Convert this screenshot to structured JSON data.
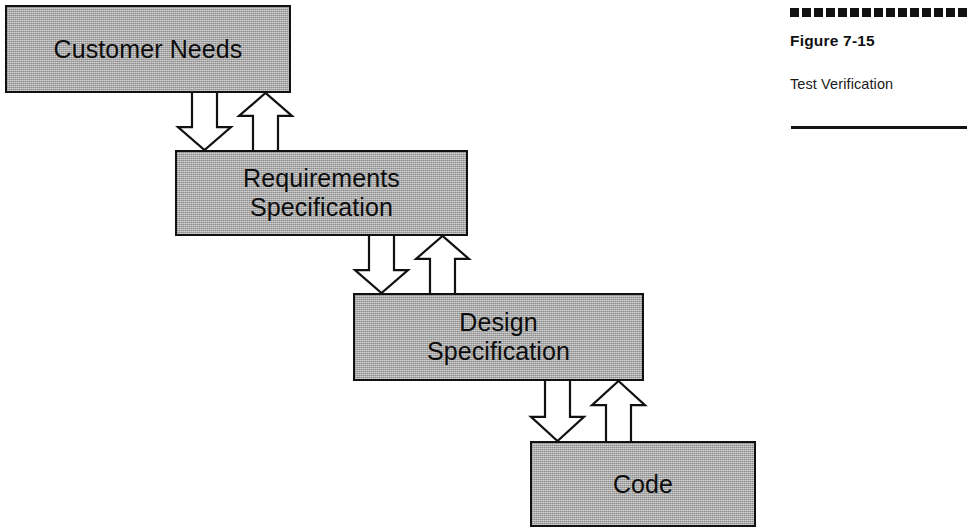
{
  "figure": {
    "number": "Figure 7-15",
    "title": "Test Verification",
    "dotted_rule_icon": "dotted-square-rule",
    "bottom_rule_icon": "horizontal-rule"
  },
  "diagram": {
    "type": "cascade-waterfall-flow",
    "box_fill_color": "#a8a8a8",
    "box_border_color": "#111111",
    "arrow_fill_color": "#ffffff",
    "arrow_stroke_color": "#111111",
    "nodes": [
      {
        "id": "customer-needs",
        "label": "Customer Needs",
        "x": 5,
        "y": 5,
        "w": 286,
        "h": 88
      },
      {
        "id": "requirements-specification",
        "label": "Requirements\nSpecification",
        "x": 175,
        "y": 150,
        "w": 293,
        "h": 86
      },
      {
        "id": "design-specification",
        "label": "Design\nSpecification",
        "x": 353,
        "y": 293,
        "w": 291,
        "h": 88
      },
      {
        "id": "code",
        "label": "Code",
        "x": 530,
        "y": 441,
        "w": 226,
        "h": 86
      }
    ],
    "connections": [
      {
        "id": "customer-needs-to-requirements",
        "from": "customer-needs",
        "to": "requirements-specification",
        "down_arrow_label": "flow-down-arrow",
        "up_arrow_label": "verify-up-arrow"
      },
      {
        "id": "requirements-to-design",
        "from": "requirements-specification",
        "to": "design-specification",
        "down_arrow_label": "flow-down-arrow",
        "up_arrow_label": "verify-up-arrow"
      },
      {
        "id": "design-to-code",
        "from": "design-specification",
        "to": "code",
        "down_arrow_label": "flow-down-arrow",
        "up_arrow_label": "verify-up-arrow"
      }
    ]
  }
}
